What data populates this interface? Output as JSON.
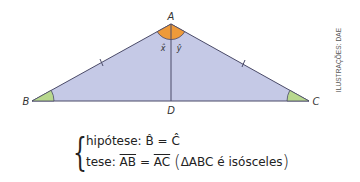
{
  "figure": {
    "vertices": {
      "A": "A",
      "B": "B",
      "C": "C",
      "D": "D"
    },
    "angle_labels": {
      "x": "x̂",
      "y": "ŷ"
    },
    "colors": {
      "triangle_fill": "#c5c9e6",
      "edge": "#4a4a68",
      "vertex_angle_fill": "#ee9a3a",
      "base_angle_fill": "#b8d88e"
    }
  },
  "credit": "ILUSTRAÇÕES: DAE",
  "statement": {
    "hypothesis_label": "hipótese:",
    "hypothesis_lhs": "B̂",
    "hypothesis_eq": "=",
    "hypothesis_rhs": "Ĉ",
    "thesis_label": "tese:",
    "thesis_lhs": "AB",
    "thesis_eq": "=",
    "thesis_rhs": "AC",
    "paren_open": "(",
    "thesis_note": "ΔABC é isósceles",
    "paren_close": ")",
    "brace": "{"
  }
}
